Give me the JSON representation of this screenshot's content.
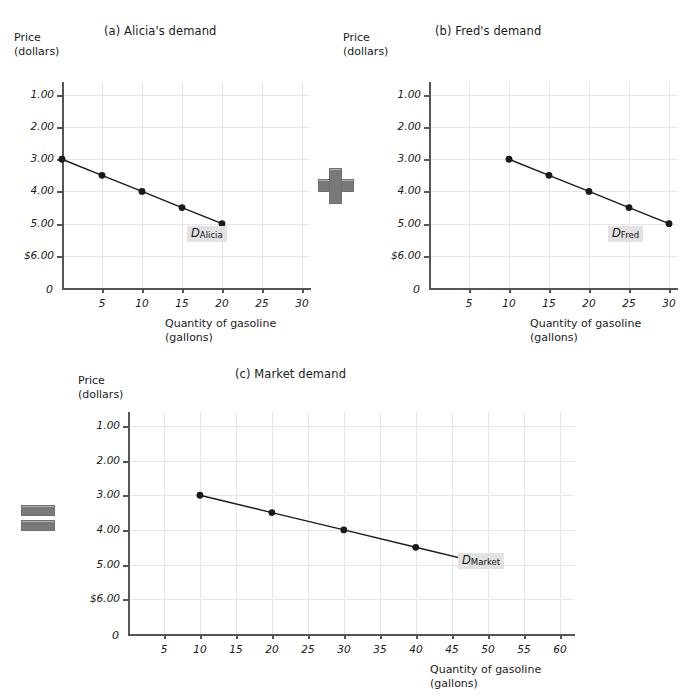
{
  "figure": {
    "background_color": "#ffffff",
    "axis_color": "#555555",
    "grid_color": "#e6e6e6",
    "curve_color": "#1a1a1a",
    "label_bg_color": "#e2e2e2",
    "operator_color": "#8a8a8a"
  },
  "operators": {
    "plus": "+",
    "equals": "="
  },
  "panels": [
    {
      "id": "a",
      "title": "(a) Alicia's demand",
      "y_axis_label_line1": "Price",
      "y_axis_label_line2": "(dollars)",
      "x_axis_label_line1": "Quantity of gasoline",
      "x_axis_label_line2": "(gallons)",
      "origin_label": "0",
      "y_ticks": [
        "$6.00",
        "5.00",
        "4.00",
        "3.00",
        "2.00",
        "1.00"
      ],
      "y_tick_values": [
        6,
        5,
        4,
        3,
        2,
        1
      ],
      "x_ticks": [
        "5",
        "10",
        "15",
        "20",
        "25",
        "30"
      ],
      "x_tick_values": [
        5,
        10,
        15,
        20,
        25,
        30
      ],
      "curve_label_main": "D",
      "curve_label_sub": "Alicia"
    },
    {
      "id": "b",
      "title": "(b) Fred's demand",
      "y_axis_label_line1": "Price",
      "y_axis_label_line2": "(dollars)",
      "x_axis_label_line1": "Quantity of gasoline",
      "x_axis_label_line2": "(gallons)",
      "origin_label": "0",
      "y_ticks": [
        "$6.00",
        "5.00",
        "4.00",
        "3.00",
        "2.00",
        "1.00"
      ],
      "y_tick_values": [
        6,
        5,
        4,
        3,
        2,
        1
      ],
      "x_ticks": [
        "5",
        "10",
        "15",
        "20",
        "25",
        "30"
      ],
      "x_tick_values": [
        5,
        10,
        15,
        20,
        25,
        30
      ],
      "curve_label_main": "D",
      "curve_label_sub": "Fred"
    },
    {
      "id": "c",
      "title": "(c) Market demand",
      "y_axis_label_line1": "Price",
      "y_axis_label_line2": "(dollars)",
      "x_axis_label_line1": "Quantity of gasoline",
      "x_axis_label_line2": "(gallons)",
      "origin_label": "0",
      "y_ticks": [
        "$6.00",
        "5.00",
        "4.00",
        "3.00",
        "2.00",
        "1.00"
      ],
      "y_tick_values": [
        6,
        5,
        4,
        3,
        2,
        1
      ],
      "x_ticks": [
        "5",
        "10",
        "15",
        "20",
        "25",
        "30",
        "35",
        "40",
        "45",
        "50",
        "55",
        "60"
      ],
      "x_tick_values": [
        5,
        10,
        15,
        20,
        25,
        30,
        35,
        40,
        45,
        50,
        55,
        60
      ],
      "curve_label_main": "D",
      "curve_label_sub": "Market"
    }
  ],
  "chart_data": [
    {
      "type": "line",
      "panel": "a",
      "title": "(a) Alicia's demand",
      "xlabel": "Quantity of gasoline (gallons)",
      "ylabel": "Price (dollars)",
      "xlim": [
        0,
        31
      ],
      "ylim": [
        0,
        6.4
      ],
      "xticks": [
        5,
        10,
        15,
        20,
        25,
        30
      ],
      "yticks": [
        1,
        2,
        3,
        4,
        5,
        6
      ],
      "grid": true,
      "legend": "D_Alicia",
      "series": [
        {
          "name": "D Alicia",
          "x": [
            0,
            5,
            10,
            15,
            20
          ],
          "y": [
            4.0,
            3.5,
            3.0,
            2.5,
            2.0
          ]
        }
      ]
    },
    {
      "type": "line",
      "panel": "b",
      "title": "(b) Fred's demand",
      "xlabel": "Quantity of gasoline (gallons)",
      "ylabel": "Price (dollars)",
      "xlim": [
        0,
        31
      ],
      "ylim": [
        0,
        6.4
      ],
      "xticks": [
        5,
        10,
        15,
        20,
        25,
        30
      ],
      "yticks": [
        1,
        2,
        3,
        4,
        5,
        6
      ],
      "grid": true,
      "legend": "D_Fred",
      "series": [
        {
          "name": "D Fred",
          "x": [
            10,
            15,
            20,
            25,
            30
          ],
          "y": [
            4.0,
            3.5,
            3.0,
            2.5,
            2.0
          ]
        }
      ]
    },
    {
      "type": "line",
      "panel": "c",
      "title": "(c) Market demand",
      "xlabel": "Quantity of gasoline (gallons)",
      "ylabel": "Price (dollars)",
      "xlim": [
        0,
        62
      ],
      "ylim": [
        0,
        6.4
      ],
      "xticks": [
        5,
        10,
        15,
        20,
        25,
        30,
        35,
        40,
        45,
        50,
        55,
        60
      ],
      "yticks": [
        1,
        2,
        3,
        4,
        5,
        6
      ],
      "grid": true,
      "legend": "D_Market",
      "series": [
        {
          "name": "D Market",
          "x": [
            10,
            20,
            30,
            40,
            50
          ],
          "y": [
            4.0,
            3.5,
            3.0,
            2.5,
            2.0
          ]
        }
      ]
    }
  ]
}
